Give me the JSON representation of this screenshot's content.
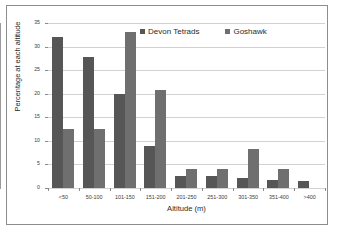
{
  "chart_data": {
    "type": "bar",
    "title": "",
    "xlabel": "Altitude (m)",
    "ylabel": "Percentage at each altitude",
    "categories": [
      "<50",
      "50-100",
      "101-150",
      "151-200",
      "201-250",
      "251-300",
      "301-350",
      "351-400",
      ">400"
    ],
    "series": [
      {
        "name": "Devon Tetrads",
        "color": "#565656",
        "values": [
          32.0,
          27.7,
          20.0,
          9.0,
          2.6,
          2.6,
          2.1,
          1.6,
          1.4
        ]
      },
      {
        "name": "Goshawk",
        "color": "#6f6f6f",
        "values": [
          12.5,
          12.5,
          33.2,
          20.8,
          4.1,
          4.1,
          8.2,
          4.1,
          0
        ]
      }
    ],
    "ylim": [
      0,
      35
    ],
    "yticks": [
      0,
      5,
      10,
      15,
      20,
      25,
      30,
      35
    ],
    "grid": true,
    "legend_position": "top-center"
  },
  "legend": {
    "items": [
      {
        "label": "Devon Tetrads",
        "color": "#565656"
      },
      {
        "label": "Goshawk",
        "color": "#6f6f6f"
      }
    ]
  }
}
